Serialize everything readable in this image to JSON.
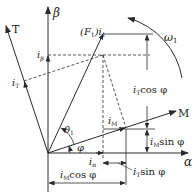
{
  "diagram": {
    "title": "",
    "type": "phasor vector diagram",
    "colors": {
      "line": "#2a2a2a",
      "background": "#ffffff"
    },
    "axes": {
      "beta": {
        "label": "β"
      },
      "alpha": {
        "label": "α"
      },
      "T": {
        "label": "T"
      },
      "M": {
        "label": "M"
      }
    },
    "rotation": {
      "label_main": "ω",
      "label_sub": "1"
    },
    "vector": {
      "label_prefix": "(F",
      "label_sub": "1",
      "label_mid": ")i",
      "label_sub2": "1"
    },
    "angles": {
      "theta": {
        "label": "θ",
        "sub": "1"
      },
      "phi": {
        "label": "φ"
      }
    },
    "components": {
      "i_beta": {
        "main": "i",
        "sub": "β"
      },
      "i_T": {
        "main": "i",
        "sub": "T"
      },
      "i_M": {
        "main": "i",
        "sub": "M"
      },
      "i_alpha": {
        "main": "i",
        "sub": "α"
      },
      "iT_cos": {
        "main": "i",
        "sub": "T",
        "rest": "cos φ"
      },
      "iM_sin": {
        "main": "i",
        "sub": "M",
        "rest": "sin φ"
      },
      "iT_sin": {
        "main": "i",
        "sub": "T",
        "rest": "sin φ"
      },
      "iM_cos": {
        "main": "i",
        "sub": "M",
        "rest": "cos φ"
      }
    }
  }
}
